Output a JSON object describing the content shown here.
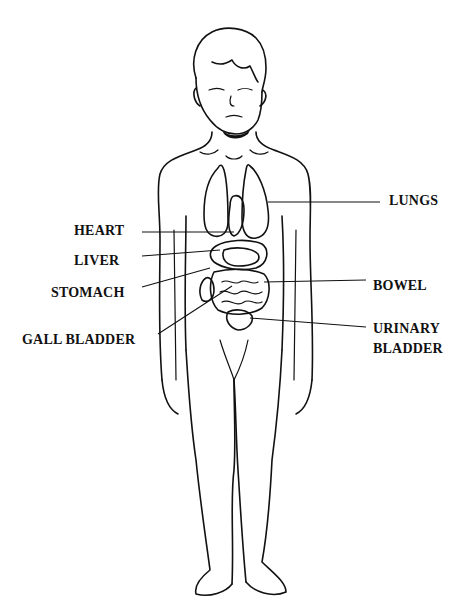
{
  "diagram": {
    "type": "anatomical-diagram",
    "labels": [
      {
        "id": "heart",
        "text": "HEART",
        "side": "left"
      },
      {
        "id": "liver",
        "text": "LIVER",
        "side": "left"
      },
      {
        "id": "stomach",
        "text": "STOMACH",
        "side": "left"
      },
      {
        "id": "gall-bladder",
        "text": "GALL BLADDER",
        "side": "left"
      },
      {
        "id": "lungs",
        "text": "LUNGS",
        "side": "right"
      },
      {
        "id": "bowel",
        "text": "BOWEL",
        "side": "right"
      },
      {
        "id": "urinary-bladder",
        "text": "URINARY\nBLADDER",
        "line1": "URINARY",
        "line2": "BLADDER",
        "side": "right"
      }
    ],
    "colors": {
      "ink": "#111111",
      "background": "#ffffff"
    }
  }
}
